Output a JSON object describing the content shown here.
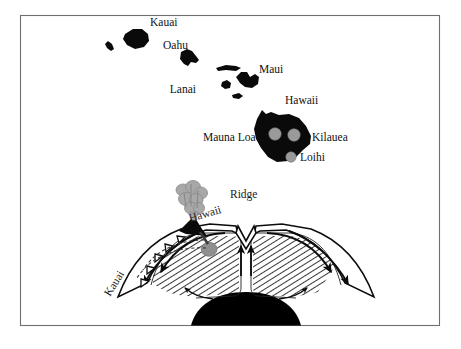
{
  "figure": {
    "frame": {
      "x": 20,
      "y": 15,
      "width": 420,
      "height": 311,
      "border_color": "#6f6f6f"
    },
    "background_color": "#ffffff"
  },
  "map_panel": {
    "name": "hawaiian-island-chain-map",
    "island_fill_color": "#0a0a0a",
    "labels": [
      {
        "id": "kauai",
        "text": "Kauai",
        "x": 150,
        "y": 26
      },
      {
        "id": "oahu",
        "text": "Oahu",
        "x": 163,
        "y": 49
      },
      {
        "id": "lanai",
        "text": "Lanai",
        "x": 196,
        "y": 93
      },
      {
        "id": "maui",
        "text": "Maui",
        "x": 259,
        "y": 73
      },
      {
        "id": "hawaii",
        "text": "Hawaii",
        "x": 285,
        "y": 104
      },
      {
        "id": "mauna-loa",
        "text": "Mauna Loa",
        "x": 203,
        "y": 141
      },
      {
        "id": "kilauea",
        "text": "Kilauea",
        "x": 312,
        "y": 141
      },
      {
        "id": "loihi",
        "text": "Loihi",
        "x": 300,
        "y": 160
      }
    ],
    "volcano_markers": [
      {
        "id": "mauna-loa-marker",
        "cx": 275,
        "cy": 134,
        "r": 6.2,
        "color": "#9a9a9a"
      },
      {
        "id": "kilauea-marker",
        "cx": 294,
        "cy": 135,
        "r": 6.2,
        "color": "#9a9a9a"
      },
      {
        "id": "loihi-marker",
        "cx": 291,
        "cy": 157,
        "r": 5.2,
        "color": "#9a9a9a"
      }
    ]
  },
  "cross_section_panel": {
    "name": "mantle-convection-cross-section",
    "labels": [
      {
        "id": "ridge",
        "text": "Ridge",
        "x": 230,
        "y": 198,
        "rotate": 0
      },
      {
        "id": "hawaii-volcano",
        "text": "Hawaii",
        "x": 190,
        "y": 222,
        "rotate": -16
      },
      {
        "id": "kauai-track",
        "text": "Kauai",
        "x": 110,
        "y": 297,
        "rotate": -58
      }
    ],
    "features": {
      "plume_color": "#a8a8a8",
      "hotspot_color": "#8f8f8f",
      "core_color": "#000000",
      "mantle_hatch_color": "#111111",
      "lithosphere_color": "#ffffff"
    }
  }
}
